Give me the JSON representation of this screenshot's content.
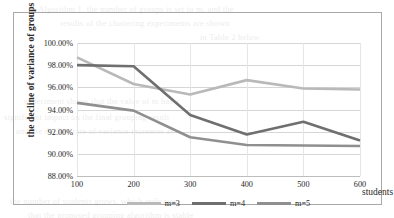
{
  "chart_data": {
    "type": "line",
    "title": "",
    "xlabel": "students",
    "ylabel": "the decline of variance of groups",
    "categories": [
      "100",
      "200",
      "300",
      "400",
      "500",
      "600"
    ],
    "x": [
      100,
      200,
      300,
      400,
      500,
      600
    ],
    "xlim": [
      100,
      600
    ],
    "ylim": [
      88.0,
      100.0
    ],
    "ytick_labels": [
      "100.00%",
      "98.00%",
      "96.00%",
      "94.00%",
      "92.00%",
      "90.00%",
      "88.00%"
    ],
    "ytick_values": [
      100.0,
      98.0,
      96.0,
      94.0,
      92.0,
      90.0,
      88.0
    ],
    "grid": true,
    "legend_position": "bottom",
    "series": [
      {
        "name": "m=3",
        "color": "#b9b9b9",
        "values": [
          98.7,
          96.3,
          95.35,
          96.65,
          95.9,
          95.8
        ]
      },
      {
        "name": "m=4",
        "color": "#6f6f6f",
        "values": [
          98.0,
          97.9,
          93.5,
          91.75,
          92.9,
          91.2
        ]
      },
      {
        "name": "m=5",
        "color": "#8f8f8f",
        "values": [
          94.6,
          93.9,
          91.5,
          90.8,
          90.75,
          90.7
        ]
      }
    ]
  },
  "bleed_text": [
    {
      "x": 38,
      "y": 4,
      "text": "Algorithm 1, the number of groups is set to m, and the"
    },
    {
      "x": 60,
      "y": 18,
      "text": "results of the clustering experiments are shown"
    },
    {
      "x": 200,
      "y": 32,
      "text": "in Table 2 below"
    },
    {
      "x": 24,
      "y": 96,
      "text": "experiment shows that the value of m has a"
    },
    {
      "x": 4,
      "y": 112,
      "text": "significant impact on the final grouping result"
    },
    {
      "x": 16,
      "y": 126,
      "text": "and the decline rate of variance increases as"
    },
    {
      "x": 10,
      "y": 196,
      "text": "the number of students grows, which indicates"
    },
    {
      "x": 28,
      "y": 210,
      "text": "that the proposed grouping algorithm is stable"
    }
  ]
}
